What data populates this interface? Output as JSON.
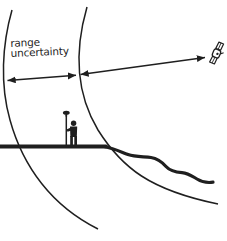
{
  "diagram": {
    "label": {
      "line1": "range",
      "line2": "uncertainty"
    },
    "colors": {
      "ink": "#1f1f1f",
      "background": "#ffffff"
    },
    "icons": {
      "satellite": "satellite-icon",
      "surveyor": "surveyor-with-gps-pole-icon",
      "uncertainty_arrow": "double-headed-arrow-icon",
      "range_arrow": "double-headed-arrow-icon"
    }
  }
}
